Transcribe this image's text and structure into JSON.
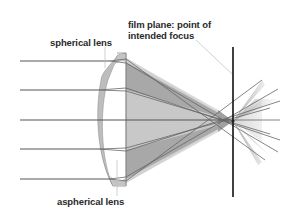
{
  "labels": {
    "spherical_lens": "spherical lens",
    "film_plane_line1": "film plane: point of",
    "film_plane_line2": "intended focus",
    "aspherical_lens": "aspherical lens"
  },
  "colors": {
    "ray": "#555555",
    "film_plane": "#111111",
    "cone_dark": "#9a9a9a",
    "cone_light": "#d4d4d4",
    "lens_fill": "#bdbdbd",
    "leader": "#bbbbbb",
    "text": "#2a2a2a"
  },
  "diagram": {
    "ray_heights": [
      61,
      90,
      120,
      149,
      179
    ],
    "film_plane_x": 233,
    "focus_point": [
      233,
      121
    ]
  }
}
